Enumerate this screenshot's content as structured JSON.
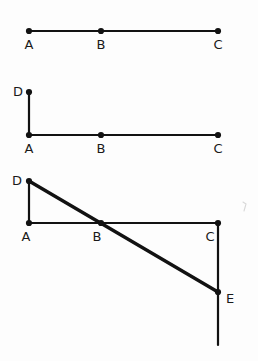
{
  "figure": {
    "canvas": {
      "width": 258,
      "height": 361,
      "background": "#fdfdfd"
    },
    "style": {
      "line_color": "#121212",
      "point_color": "#121212",
      "label_color": "#1a1a1a",
      "thin_stroke_width": 2.2,
      "thick_stroke_width": 3.4,
      "point_radius": 3.1,
      "label_font_size": "13px"
    },
    "panels": [
      {
        "id": "panel-1",
        "name": "segment-abc",
        "points": [
          {
            "id": "A",
            "label": "A",
            "x": 29,
            "y": 31,
            "label_x": 29,
            "label_y": 49,
            "label_anchor": "middle"
          },
          {
            "id": "B",
            "label": "B",
            "x": 101,
            "y": 31,
            "label_x": 101,
            "label_y": 49,
            "label_anchor": "middle"
          },
          {
            "id": "C",
            "label": "C",
            "x": 218,
            "y": 31,
            "label_x": 218,
            "label_y": 49,
            "label_anchor": "middle"
          }
        ],
        "segments": [
          {
            "id": "AC",
            "name": "segment-a-to-c",
            "x1": 29,
            "y1": 31,
            "x2": 218,
            "y2": 31,
            "weight": "thin"
          }
        ]
      },
      {
        "id": "panel-2",
        "name": "segment-abc-with-da",
        "points": [
          {
            "id": "D",
            "label": "D",
            "x": 29,
            "y": 92,
            "label_x": 18,
            "label_y": 96,
            "label_anchor": "middle"
          },
          {
            "id": "A",
            "label": "A",
            "x": 29,
            "y": 135,
            "label_x": 29,
            "label_y": 153,
            "label_anchor": "middle"
          },
          {
            "id": "B",
            "label": "B",
            "x": 101,
            "y": 135,
            "label_x": 101,
            "label_y": 153,
            "label_anchor": "middle"
          },
          {
            "id": "C",
            "label": "C",
            "x": 218,
            "y": 135,
            "label_x": 218,
            "label_y": 153,
            "label_anchor": "middle"
          }
        ],
        "segments": [
          {
            "id": "DA",
            "name": "segment-d-to-a",
            "x1": 29,
            "y1": 92,
            "x2": 29,
            "y2": 135,
            "weight": "thin"
          },
          {
            "id": "AC",
            "name": "segment-a-to-c",
            "x1": 29,
            "y1": 135,
            "x2": 218,
            "y2": 135,
            "weight": "thin"
          }
        ]
      },
      {
        "id": "panel-3",
        "name": "full-construction-with-de-and-ce",
        "points": [
          {
            "id": "D",
            "label": "D",
            "x": 29,
            "y": 181,
            "label_x": 17,
            "label_y": 185,
            "label_anchor": "middle"
          },
          {
            "id": "A",
            "label": "A",
            "x": 29,
            "y": 223,
            "label_x": 26,
            "label_y": 241,
            "label_anchor": "middle"
          },
          {
            "id": "B",
            "label": "B",
            "x": 101,
            "y": 223,
            "label_x": 97,
            "label_y": 241,
            "label_anchor": "middle"
          },
          {
            "id": "C",
            "label": "C",
            "x": 218,
            "y": 223,
            "label_x": 210,
            "label_y": 241,
            "label_anchor": "middle"
          },
          {
            "id": "E",
            "label": "E",
            "x": 218,
            "y": 292,
            "label_x": 230,
            "label_y": 303,
            "label_anchor": "middle"
          }
        ],
        "segments": [
          {
            "id": "DA",
            "name": "segment-d-to-a",
            "x1": 29,
            "y1": 181,
            "x2": 29,
            "y2": 223,
            "weight": "thin"
          },
          {
            "id": "AC",
            "name": "segment-a-to-c",
            "x1": 29,
            "y1": 223,
            "x2": 218,
            "y2": 223,
            "weight": "thin"
          },
          {
            "id": "CE",
            "name": "segment-c-through-e-extended",
            "x1": 218,
            "y1": 223,
            "x2": 218,
            "y2": 345,
            "weight": "thin"
          },
          {
            "id": "DE",
            "name": "segment-d-to-e-diagonal",
            "x1": 29,
            "y1": 181,
            "x2": 218,
            "y2": 292,
            "weight": "thick"
          }
        ],
        "marks": [
          {
            "id": "mark-1",
            "name": "faint-pencil-mark",
            "d": "M 243 202 L 246 204 L 244 211"
          }
        ]
      }
    ]
  }
}
